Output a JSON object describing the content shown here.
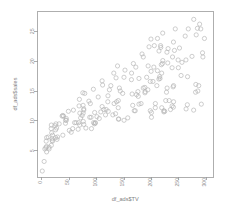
{
  "figure": {
    "background_color": "#ffffff",
    "frame_color": "#9a9a9a",
    "point_color": "#b4b4b4"
  },
  "chart_data": {
    "type": "scatter",
    "title": "",
    "xlabel": "df_ads$TV",
    "ylabel": "df_ads$sales",
    "xlim": [
      -8,
      312
    ],
    "ylim": [
      0.6,
      28.4
    ],
    "xticks": [
      0,
      50,
      100,
      150,
      200,
      250,
      300
    ],
    "yticks": [
      5,
      10,
      15,
      20,
      25
    ],
    "xtick_labels": [
      "0",
      "50",
      "100",
      "150",
      "200",
      "250",
      "300"
    ],
    "ytick_labels": [
      "5",
      "10",
      "15",
      "20",
      "25"
    ],
    "grid": false,
    "legend": null,
    "marker": "open-circle",
    "marker_size": 2.1,
    "n_points": 200,
    "x": [
      230.1,
      44.5,
      17.2,
      151.5,
      180.8,
      8.7,
      57.5,
      120.2,
      8.6,
      199.8,
      66.1,
      214.7,
      23.8,
      97.5,
      204.1,
      195.4,
      67.8,
      281.4,
      69.2,
      147.3,
      218.4,
      237.4,
      13.2,
      228.3,
      62.3,
      262.9,
      142.9,
      240.1,
      248.8,
      70.6,
      292.9,
      112.9,
      97.2,
      265.6,
      95.7,
      290.7,
      266.9,
      74.7,
      43.1,
      228.0,
      202.5,
      177.0,
      293.6,
      206.9,
      25.1,
      175.1,
      89.7,
      239.9,
      227.2,
      66.9,
      199.8,
      100.4,
      216.4,
      182.6,
      262.7,
      198.9,
      7.3,
      136.2,
      210.8,
      210.7,
      53.5,
      261.3,
      239.3,
      102.7,
      131.1,
      69.0,
      31.5,
      139.3,
      237.4,
      216.8,
      199.1,
      109.8,
      26.8,
      129.4,
      213.4,
      16.9,
      27.5,
      120.5,
      5.4,
      116.0,
      76.4,
      239.8,
      75.3,
      68.4,
      213.5,
      193.2,
      76.3,
      110.7,
      88.3,
      109.8,
      134.3,
      28.6,
      217.7,
      250.9,
      107.4,
      163.3,
      197.6,
      184.9,
      289.7,
      135.2,
      222.4,
      296.4,
      280.2,
      187.9,
      238.2,
      137.9,
      25.0,
      90.4,
      13.1,
      255.4,
      225.8,
      241.7,
      175.7,
      209.6,
      78.2,
      75.1,
      139.2,
      76.4,
      125.7,
      19.4,
      141.3,
      18.8,
      224.0,
      123.1,
      229.5,
      87.2,
      7.8,
      80.2,
      220.3,
      59.6,
      0.7,
      265.2,
      8.4,
      219.8,
      36.9,
      48.3,
      25.6,
      273.7,
      43.0,
      184.9,
      73.4,
      193.7,
      220.5,
      104.6,
      96.2,
      140.3,
      240.1,
      243.2,
      38.0,
      44.7,
      280.7,
      121.0,
      197.6,
      171.3,
      187.8,
      4.1,
      93.9,
      149.8,
      11.7,
      131.7,
      172.5,
      85.7,
      188.4,
      163.5,
      117.2,
      234.5,
      17.9,
      206.8,
      215.4,
      284.3,
      50.0,
      164.5,
      19.6,
      168.4,
      222.4,
      276.9,
      248.4,
      170.2,
      276.7,
      165.6,
      156.6,
      218.5,
      56.2,
      287.6,
      253.8,
      205.0,
      139.5,
      191.1,
      286.0,
      18.7,
      39.5,
      75.5,
      17.2,
      166.8,
      149.7,
      38.2,
      94.2,
      177.0,
      283.6,
      232.1
    ],
    "y": [
      22.1,
      10.4,
      9.3,
      18.5,
      12.9,
      7.2,
      11.8,
      13.2,
      4.8,
      10.6,
      8.6,
      17.4,
      9.2,
      9.7,
      19.0,
      22.4,
      12.5,
      24.4,
      11.3,
      14.6,
      18.0,
      12.5,
      5.6,
      15.5,
      9.7,
      12.0,
      15.0,
      15.9,
      18.9,
      10.5,
      21.4,
      11.9,
      9.6,
      17.4,
      9.5,
      12.8,
      25.4,
      14.7,
      10.1,
      21.5,
      16.6,
      17.1,
      20.7,
      12.9,
      8.5,
      14.9,
      10.6,
      23.2,
      14.8,
      9.7,
      11.4,
      10.7,
      22.6,
      21.2,
      20.2,
      23.7,
      5.5,
      13.2,
      23.8,
      18.4,
      8.1,
      24.2,
      15.7,
      14.0,
      18.0,
      9.3,
      9.5,
      13.4,
      18.9,
      22.3,
      18.3,
      12.4,
      8.8,
      11.0,
      17.0,
      8.7,
      6.9,
      14.2,
      5.3,
      11.0,
      11.8,
      12.3,
      11.3,
      13.6,
      21.7,
      15.2,
      12.0,
      16.0,
      12.9,
      16.7,
      11.2,
      7.3,
      19.4,
      22.2,
      11.5,
      16.9,
      11.7,
      15.5,
      25.4,
      17.2,
      11.7,
      23.8,
      14.8,
      14.7,
      20.7,
      19.2,
      7.2,
      8.7,
      5.3,
      19.8,
      13.4,
      21.8,
      14.1,
      15.9,
      14.6,
      12.6,
      12.2,
      9.4,
      15.9,
      6.6,
      15.5,
      7.0,
      11.6,
      15.2,
      19.7,
      10.6,
      6.6,
      8.8,
      24.7,
      9.7,
      1.6,
      12.7,
      5.7,
      19.6,
      10.8,
      11.6,
      9.5,
      20.8,
      9.6,
      20.7,
      10.9,
      19.2,
      20.1,
      10.4,
      11.4,
      10.3,
      13.2,
      25.4,
      10.9,
      10.1,
      16.1,
      11.6,
      16.6,
      19.0,
      15.6,
      3.2,
      15.3,
      10.1,
      7.3,
      12.9,
      14.4,
      13.3,
      14.9,
      18.0,
      11.9,
      11.9,
      8.0,
      12.2,
      17.1,
      15.0,
      8.4,
      14.5,
      7.6,
      11.7,
      11.5,
      27.0,
      20.2,
      11.7,
      11.8,
      12.6,
      10.5,
      12.2,
      8.7,
      26.2,
      17.6,
      22.6,
      10.3,
      17.3,
      15.9,
      6.7,
      10.8,
      9.9,
      5.9,
      19.6,
      17.3,
      7.6,
      9.7,
      12.8,
      25.5,
      13.4
    ]
  }
}
